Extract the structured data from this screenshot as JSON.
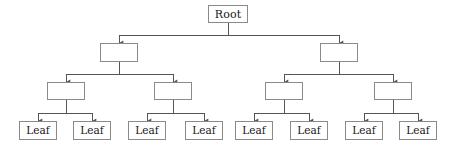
{
  "diagram": {
    "type": "tree",
    "depth": 4,
    "orientation": "top-down",
    "style": {
      "box_fill": "#ffffff",
      "box_border": "#8a8a8a",
      "edge_color": "#555555",
      "text_color": "#161616",
      "background": "#ffffff",
      "edge_width": 1,
      "arrowhead": "filled-triangle"
    },
    "levels": [
      {
        "index": 0,
        "name": "root-level",
        "y_top": 5,
        "y_bottom": 23,
        "bus_y": 35
      },
      {
        "index": 1,
        "name": "branch-level-1",
        "y_top": 43,
        "y_bottom": 62,
        "bus_y": 74
      },
      {
        "index": 2,
        "name": "branch-level-2",
        "y_top": 82,
        "y_bottom": 100,
        "bus_y": 113
      },
      {
        "index": 3,
        "name": "leaf-level",
        "y_top": 121,
        "y_bottom": 140,
        "bus_y": null
      }
    ],
    "nodes": [
      {
        "id": "root",
        "label": "Root",
        "level": 0,
        "x": 208,
        "y": 5,
        "w": 40,
        "h": 18,
        "cx": 228,
        "kind": "root"
      },
      {
        "id": "b1",
        "label": "",
        "level": 1,
        "x": 100,
        "y": 43,
        "w": 38,
        "h": 19,
        "cx": 119,
        "kind": "internal"
      },
      {
        "id": "b2",
        "label": "",
        "level": 1,
        "x": 320,
        "y": 43,
        "w": 38,
        "h": 19,
        "cx": 339,
        "kind": "internal"
      },
      {
        "id": "c1",
        "label": "",
        "level": 2,
        "x": 47,
        "y": 82,
        "w": 38,
        "h": 18,
        "cx": 66,
        "kind": "internal"
      },
      {
        "id": "c2",
        "label": "",
        "level": 2,
        "x": 154,
        "y": 82,
        "w": 38,
        "h": 18,
        "cx": 173,
        "kind": "internal"
      },
      {
        "id": "c3",
        "label": "",
        "level": 2,
        "x": 265,
        "y": 82,
        "w": 38,
        "h": 18,
        "cx": 284,
        "kind": "internal"
      },
      {
        "id": "c4",
        "label": "",
        "level": 2,
        "x": 374,
        "y": 82,
        "w": 38,
        "h": 18,
        "cx": 393,
        "kind": "internal"
      },
      {
        "id": "l1",
        "label": "Leaf",
        "level": 3,
        "x": 19,
        "y": 121,
        "w": 38,
        "h": 19,
        "cx": 38,
        "kind": "leaf"
      },
      {
        "id": "l2",
        "label": "Leaf",
        "level": 3,
        "x": 73,
        "y": 121,
        "w": 38,
        "h": 19,
        "cx": 92,
        "kind": "leaf"
      },
      {
        "id": "l3",
        "label": "Leaf",
        "level": 3,
        "x": 128,
        "y": 121,
        "w": 38,
        "h": 19,
        "cx": 147,
        "kind": "leaf"
      },
      {
        "id": "l4",
        "label": "Leaf",
        "level": 3,
        "x": 185,
        "y": 121,
        "w": 38,
        "h": 19,
        "cx": 204,
        "kind": "leaf"
      },
      {
        "id": "l5",
        "label": "Leaf",
        "level": 3,
        "x": 235,
        "y": 121,
        "w": 38,
        "h": 19,
        "cx": 254,
        "kind": "leaf"
      },
      {
        "id": "l6",
        "label": "Leaf",
        "level": 3,
        "x": 290,
        "y": 121,
        "w": 38,
        "h": 19,
        "cx": 309,
        "kind": "leaf"
      },
      {
        "id": "l7",
        "label": "Leaf",
        "level": 3,
        "x": 345,
        "y": 121,
        "w": 38,
        "h": 19,
        "cx": 364,
        "kind": "leaf"
      },
      {
        "id": "l8",
        "label": "Leaf",
        "level": 3,
        "x": 399,
        "y": 121,
        "w": 38,
        "h": 19,
        "cx": 418,
        "kind": "leaf"
      }
    ],
    "edges": [
      {
        "from": "root",
        "to": "b1"
      },
      {
        "from": "root",
        "to": "b2"
      },
      {
        "from": "b1",
        "to": "c1"
      },
      {
        "from": "b1",
        "to": "c2"
      },
      {
        "from": "b2",
        "to": "c3"
      },
      {
        "from": "b2",
        "to": "c4"
      },
      {
        "from": "c1",
        "to": "l1"
      },
      {
        "from": "c1",
        "to": "l2"
      },
      {
        "from": "c2",
        "to": "l3"
      },
      {
        "from": "c2",
        "to": "l4"
      },
      {
        "from": "c3",
        "to": "l5"
      },
      {
        "from": "c3",
        "to": "l6"
      },
      {
        "from": "c4",
        "to": "l7"
      },
      {
        "from": "c4",
        "to": "l8"
      }
    ]
  }
}
